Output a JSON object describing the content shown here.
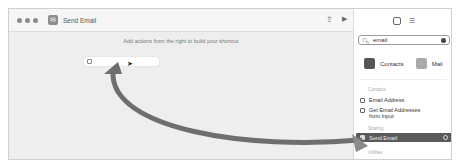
{
  "window": {
    "title": "Send Email"
  },
  "toolbar": {
    "share_icon": "share-icon",
    "run_icon": "play-icon"
  },
  "canvas": {
    "hint": "Add actions from the right to build your shortcut"
  },
  "sidebar": {
    "search": {
      "value": "email"
    },
    "apps": [
      {
        "label": "Contacts"
      },
      {
        "label": "Mail"
      }
    ],
    "sections": [
      {
        "title": "Contacts",
        "items": [
          {
            "label": "Email Address"
          },
          {
            "label": "Get Email Addresses from Input"
          }
        ]
      },
      {
        "title": "Sharing",
        "items": [
          {
            "label": "Send Email",
            "selected": true
          }
        ]
      },
      {
        "title": "Utilities",
        "items": []
      }
    ]
  },
  "annotation": {
    "arrow_color": "#6e6e6e"
  }
}
